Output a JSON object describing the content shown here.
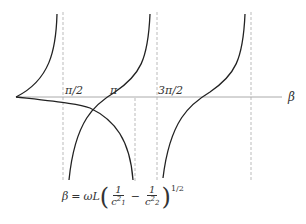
{
  "diagram": {
    "axis_label": "β",
    "tick_labels": [
      "π/2",
      "π",
      "3π/2"
    ],
    "asymptotes": [
      "π/2",
      "π",
      "3π/2",
      "2π"
    ],
    "colors": {
      "curve": "#222222",
      "axis": "#aaaaaa",
      "dashed": "#bbbbbb",
      "text": "#333333"
    },
    "formula": {
      "lhs": "β",
      "eq": "=",
      "coeff": "ωL",
      "frac1_num": "1",
      "frac1_den": "c",
      "frac1_den_sub": "1",
      "frac1_den_sup": "2",
      "minus": "−",
      "frac2_num": "1",
      "frac2_den": "c",
      "frac2_den_sub": "2",
      "frac2_den_sup": "2",
      "exponent": "1/2"
    }
  }
}
